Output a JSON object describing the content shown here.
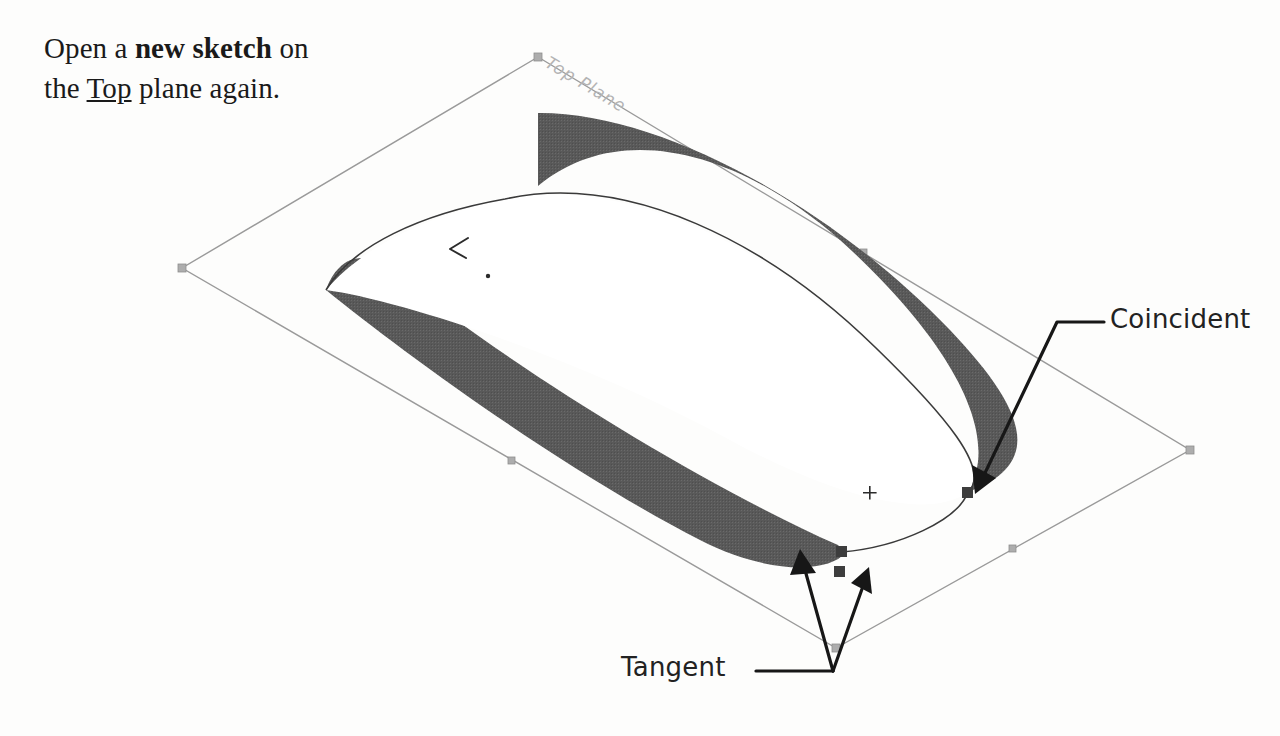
{
  "document": {
    "title": "SolidWorks tutorial step - new sketch on Top plane",
    "background_color": "#fdfdfc"
  },
  "instructions": [
    {
      "id": "new-sketch",
      "segments": [
        {
          "text": "Open a ",
          "style": "normal"
        },
        {
          "text": "new sketch",
          "style": "bold"
        },
        {
          "text": " on\nthe ",
          "style": "normal"
        },
        {
          "text": "Top",
          "style": "underline"
        },
        {
          "text": " plane again.",
          "style": "normal"
        }
      ],
      "plain_text": "Open a new sketch on the Top plane again."
    },
    {
      "id": "three-point-arc",
      "segments": [
        {
          "text": "Sketch another\n",
          "style": "normal"
        },
        {
          "text": "3-Point-Arc",
          "style": "bold"
        },
        {
          "text": " and\nadd the relations\nas indicated.",
          "style": "normal"
        }
      ],
      "plain_text": "Sketch another 3-Point-Arc and add the relations as indicated."
    },
    {
      "id": "exit-sketch",
      "segments": [
        {
          "text": "Exit",
          "style": "underline"
        },
        {
          "text": " the Sketch.",
          "style": "normal"
        }
      ],
      "plain_text": "Exit the Sketch."
    }
  ],
  "callouts": [
    {
      "id": "coincident",
      "label": "Coincident",
      "target_count": 1,
      "relation_type": "coincident"
    },
    {
      "id": "tangent",
      "label": "Tangent",
      "target_count": 2,
      "relation_type": "tangent"
    }
  ],
  "viewport": {
    "plane_label": "Top Plane",
    "plane_color": "#9a9a9a",
    "solid_color": "#595959",
    "sketch_color": "#3a3a3a",
    "relation_glyph_color": "#3d3d3d",
    "leader_color": "#171717"
  },
  "geometry": {
    "plane_corners": [
      {
        "name": "top",
        "x": 538,
        "y": 57
      },
      {
        "name": "right",
        "x": 1190,
        "y": 450
      },
      {
        "name": "bottom",
        "x": 836,
        "y": 648
      },
      {
        "name": "left",
        "x": 182,
        "y": 268
      }
    ],
    "plane_midpoint_grips": [
      {
        "x": 512,
        "y": 461
      },
      {
        "x": 1013,
        "y": 549
      },
      {
        "x": 864,
        "y": 253
      }
    ],
    "relation_glyphs": [
      {
        "type": "coincident",
        "x": 968,
        "y": 493
      },
      {
        "type": "tangent",
        "x": 842,
        "y": 552
      },
      {
        "type": "tangent",
        "x": 840,
        "y": 572
      }
    ],
    "cursor_marker": {
      "x": 457,
      "y": 248
    },
    "origin_dot": {
      "x": 488,
      "y": 276
    }
  }
}
